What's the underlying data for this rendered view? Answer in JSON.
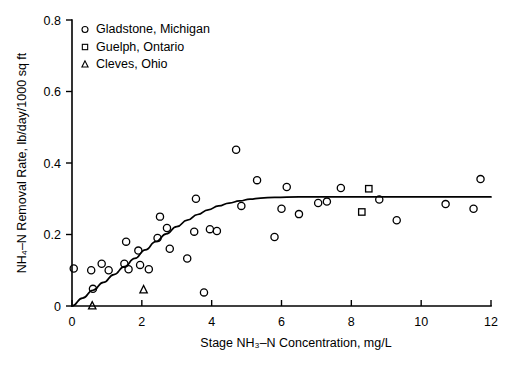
{
  "chart_data": {
    "type": "scatter",
    "title": "",
    "xlabel": "Stage NH₃–N Concentration, mg/L",
    "ylabel": "NH₄–N Removal Rate, lb/day/1000 sq ft",
    "xlim": [
      0,
      12
    ],
    "ylim": [
      0,
      0.8
    ],
    "xticks": [
      0,
      2,
      4,
      6,
      8,
      10,
      12
    ],
    "xticklabels": [
      "0",
      "2",
      "4",
      "6",
      "8",
      "10",
      "12"
    ],
    "yticks": [
      0,
      0.2,
      0.4,
      0.6,
      0.8
    ],
    "yticklabels": [
      "0",
      "0.2",
      "0.4",
      "0.6",
      "0.8"
    ],
    "grid": false,
    "legend_position": "upper left",
    "series": [
      {
        "name": "Gladstone, Michigan",
        "marker": "circle",
        "points": [
          [
            0.05,
            0.105
          ],
          [
            0.55,
            0.1
          ],
          [
            0.6,
            0.048
          ],
          [
            0.85,
            0.118
          ],
          [
            1.05,
            0.1
          ],
          [
            1.5,
            0.118
          ],
          [
            1.55,
            0.18
          ],
          [
            1.62,
            0.103
          ],
          [
            1.9,
            0.155
          ],
          [
            1.95,
            0.115
          ],
          [
            2.2,
            0.103
          ],
          [
            2.45,
            0.19
          ],
          [
            2.52,
            0.25
          ],
          [
            2.72,
            0.218
          ],
          [
            2.8,
            0.16
          ],
          [
            3.3,
            0.133
          ],
          [
            3.5,
            0.208
          ],
          [
            3.55,
            0.3
          ],
          [
            3.78,
            0.038
          ],
          [
            3.95,
            0.215
          ],
          [
            4.15,
            0.21
          ],
          [
            4.7,
            0.437
          ],
          [
            4.85,
            0.28
          ],
          [
            5.3,
            0.352
          ],
          [
            5.8,
            0.193
          ],
          [
            6.0,
            0.272
          ],
          [
            6.15,
            0.333
          ],
          [
            6.5,
            0.257
          ],
          [
            7.05,
            0.288
          ],
          [
            7.3,
            0.292
          ],
          [
            7.7,
            0.33
          ],
          [
            8.8,
            0.298
          ],
          [
            9.3,
            0.24
          ],
          [
            10.7,
            0.285
          ],
          [
            11.5,
            0.272
          ],
          [
            11.7,
            0.355
          ]
        ]
      },
      {
        "name": "Guelph, Ontario",
        "marker": "square",
        "points": [
          [
            8.3,
            0.263
          ],
          [
            8.5,
            0.328
          ]
        ]
      },
      {
        "name": "Cleves, Ohio",
        "marker": "triangle",
        "points": [
          [
            0.58,
            0.0
          ],
          [
            2.05,
            0.045
          ]
        ]
      }
    ],
    "fit_curve": {
      "name": "fitted saturation curve",
      "points": [
        [
          0.0,
          0.0
        ],
        [
          0.3,
          0.022
        ],
        [
          0.6,
          0.044
        ],
        [
          0.9,
          0.066
        ],
        [
          1.2,
          0.088
        ],
        [
          1.5,
          0.11
        ],
        [
          1.8,
          0.133
        ],
        [
          2.1,
          0.157
        ],
        [
          2.4,
          0.18
        ],
        [
          2.7,
          0.202
        ],
        [
          3.0,
          0.222
        ],
        [
          3.3,
          0.24
        ],
        [
          3.6,
          0.256
        ],
        [
          3.9,
          0.269
        ],
        [
          4.2,
          0.28
        ],
        [
          4.5,
          0.288
        ],
        [
          4.8,
          0.294
        ],
        [
          5.1,
          0.299
        ],
        [
          5.4,
          0.302
        ],
        [
          5.8,
          0.304
        ],
        [
          6.5,
          0.305
        ],
        [
          8.0,
          0.305
        ],
        [
          10.0,
          0.305
        ],
        [
          12.0,
          0.305
        ]
      ]
    }
  },
  "legend": {
    "entries": [
      {
        "label": "Gladstone, Michigan",
        "marker": "circle"
      },
      {
        "label": "Guelph, Ontario",
        "marker": "square"
      },
      {
        "label": "Cleves, Ohio",
        "marker": "triangle"
      }
    ]
  }
}
